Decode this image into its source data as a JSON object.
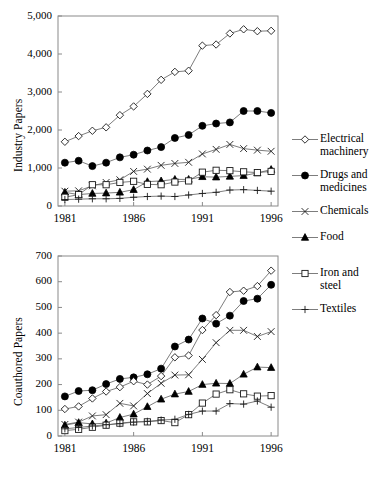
{
  "figure": {
    "title": "",
    "background": "#ffffff",
    "line_color": "#5c5c5c",
    "frame_color": "#8a8a8a",
    "marker_color": "#000000"
  },
  "legend": {
    "position": "right",
    "entries": [
      {
        "label": "Electrical\nmachinery",
        "marker": "open-diamond",
        "name": "electrical-machinery"
      },
      {
        "label": "Drugs and\nmedicines",
        "marker": "filled-circle",
        "name": "drugs-and-medicines"
      },
      {
        "label": "Chemicals",
        "marker": "cross-x",
        "name": "chemicals"
      },
      {
        "label": "Food",
        "marker": "filled-triangle",
        "name": "food"
      },
      {
        "label": "Iron and\nsteel",
        "marker": "open-square",
        "name": "iron-and-steel"
      },
      {
        "label": "Textiles",
        "marker": "plus",
        "name": "textiles"
      }
    ]
  },
  "chart_data": [
    {
      "type": "line",
      "id": "industry-papers",
      "title": "",
      "xlabel": "",
      "ylabel": "Industry Papers",
      "x": [
        1981,
        1982,
        1983,
        1984,
        1985,
        1986,
        1987,
        1988,
        1989,
        1990,
        1991,
        1992,
        1993,
        1994,
        1995,
        1996
      ],
      "xlim": [
        1980.5,
        1996.5
      ],
      "ylim": [
        0,
        5000
      ],
      "xticks": [
        1981,
        1986,
        1991,
        1996
      ],
      "xtick_labels": [
        "1981",
        "1986",
        "1991",
        "1996"
      ],
      "yticks": [
        0,
        1000,
        2000,
        3000,
        4000,
        5000
      ],
      "ytick_labels": [
        "0",
        "1,000",
        "2,000",
        "3,000",
        "4,000",
        "5,000"
      ],
      "grid": false,
      "series": [
        {
          "name": "Electrical machinery",
          "marker": "open-diamond",
          "values": [
            1690,
            1840,
            1980,
            2070,
            2390,
            2620,
            2950,
            3320,
            3530,
            3560,
            4220,
            4250,
            4540,
            4650,
            4600,
            4610
          ]
        },
        {
          "name": "Drugs and medicines",
          "marker": "filled-circle",
          "values": [
            1140,
            1190,
            1050,
            1140,
            1280,
            1350,
            1460,
            1550,
            1790,
            1870,
            2110,
            2170,
            2200,
            2500,
            2500,
            2450
          ]
        },
        {
          "name": "Chemicals",
          "marker": "cross-x",
          "values": [
            390,
            400,
            530,
            620,
            690,
            910,
            970,
            1070,
            1120,
            1150,
            1370,
            1490,
            1620,
            1510,
            1470,
            1440
          ]
        },
        {
          "name": "Food",
          "marker": "filled-triangle",
          "values": [
            360,
            300,
            330,
            340,
            360,
            430,
            640,
            660,
            700,
            700,
            770,
            760,
            780,
            800,
            870,
            960
          ]
        },
        {
          "name": "Iron and steel",
          "marker": "open-square",
          "values": [
            230,
            300,
            560,
            560,
            620,
            650,
            570,
            560,
            630,
            660,
            890,
            940,
            930,
            900,
            880,
            910
          ]
        },
        {
          "name": "Textiles",
          "marker": "plus",
          "values": [
            170,
            180,
            190,
            190,
            200,
            230,
            250,
            260,
            250,
            290,
            330,
            360,
            420,
            430,
            410,
            390
          ]
        }
      ]
    },
    {
      "type": "line",
      "id": "coauthored-papers",
      "title": "",
      "xlabel": "",
      "ylabel": "Coauthored Papers",
      "x": [
        1981,
        1982,
        1983,
        1984,
        1985,
        1986,
        1987,
        1988,
        1989,
        1990,
        1991,
        1992,
        1993,
        1994,
        1995,
        1996
      ],
      "xlim": [
        1980.5,
        1996.5
      ],
      "ylim": [
        0,
        700
      ],
      "xticks": [
        1981,
        1986,
        1991,
        1996
      ],
      "xtick_labels": [
        "1981",
        "1986",
        "1991",
        "1996"
      ],
      "yticks": [
        0,
        100,
        200,
        300,
        400,
        500,
        600,
        700
      ],
      "ytick_labels": [
        "0",
        "100",
        "200",
        "300",
        "400",
        "500",
        "600",
        "700"
      ],
      "grid": false,
      "series": [
        {
          "name": "Drugs and medicines",
          "marker": "filled-circle",
          "values": [
            154,
            175,
            178,
            202,
            222,
            228,
            240,
            262,
            348,
            375,
            457,
            437,
            468,
            525,
            534,
            588
          ]
        },
        {
          "name": "Electrical machinery",
          "marker": "open-diamond",
          "values": [
            105,
            115,
            146,
            173,
            190,
            213,
            200,
            233,
            306,
            313,
            412,
            470,
            560,
            565,
            583,
            643
          ]
        },
        {
          "name": "Chemicals",
          "marker": "cross-x",
          "values": [
            45,
            54,
            78,
            83,
            127,
            117,
            165,
            205,
            237,
            238,
            298,
            363,
            411,
            411,
            387,
            406
          ]
        },
        {
          "name": "Food",
          "marker": "filled-triangle",
          "values": [
            42,
            52,
            47,
            50,
            72,
            85,
            114,
            143,
            163,
            173,
            200,
            205,
            204,
            240,
            268,
            266
          ]
        },
        {
          "name": "Iron and steel",
          "marker": "open-square",
          "values": [
            21,
            26,
            34,
            42,
            50,
            55,
            55,
            60,
            52,
            83,
            128,
            163,
            180,
            164,
            155,
            157
          ]
        },
        {
          "name": "Textiles",
          "marker": "plus",
          "values": [
            28,
            33,
            39,
            44,
            48,
            54,
            57,
            62,
            65,
            84,
            97,
            97,
            126,
            124,
            136,
            112
          ]
        }
      ]
    }
  ]
}
